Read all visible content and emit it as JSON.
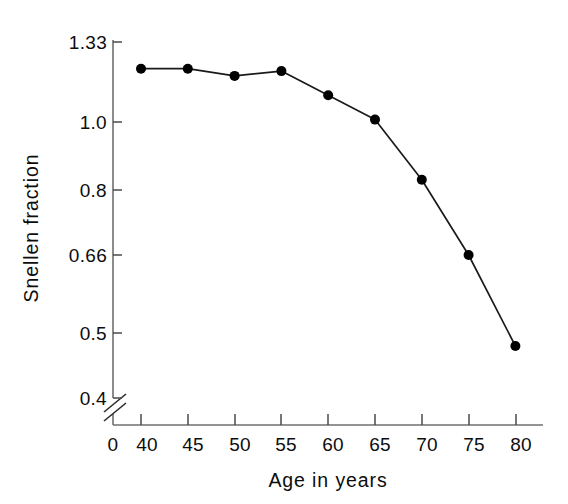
{
  "chart_data": {
    "type": "line",
    "title": "",
    "xlabel": "Age in years",
    "ylabel": "Snellen fraction",
    "x": [
      40,
      45,
      50,
      55,
      60,
      65,
      70,
      75,
      80
    ],
    "values": [
      1.22,
      1.22,
      1.19,
      1.21,
      1.11,
      1.01,
      0.83,
      0.66,
      0.48
    ],
    "series": [
      {
        "name": "Snellen fraction by age",
        "values": [
          1.22,
          1.22,
          1.19,
          1.21,
          1.11,
          1.01,
          0.83,
          0.66,
          0.48
        ]
      }
    ],
    "x_tick_labels": [
      "0",
      "40",
      "45",
      "50",
      "55",
      "60",
      "65",
      "70",
      "75",
      "80"
    ],
    "y_tick_labels": [
      "1.33",
      "1.0",
      "0.8",
      "0.66",
      "0.5",
      "0.4"
    ],
    "y_tick_values": [
      1.33,
      1.0,
      0.8,
      0.66,
      0.5,
      0.4
    ],
    "xlim": [
      40,
      80
    ],
    "ylim": [
      0.4,
      1.33
    ],
    "grid": false,
    "legend": "none",
    "axis_break": "y-axis break below 0.4",
    "marker_style": "filled-circle",
    "line_color": "#1a1a1a",
    "marker_color": "#000000",
    "axis_color": "#6f6f6f",
    "background_color": "#ffffff"
  }
}
